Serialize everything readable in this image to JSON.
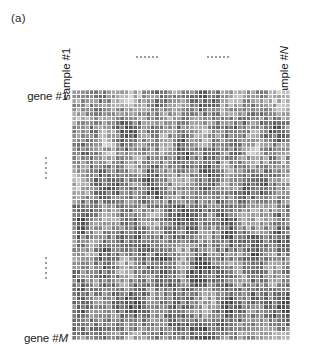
{
  "figure": {
    "panel_label": "(a)",
    "caption_type": "gene-expression-heatmap"
  },
  "axes": {
    "columns": {
      "first_label": "sample #1",
      "last_label_prefix": "sample #",
      "last_label_var": "N",
      "ellipsis_count": 2,
      "ellipsis_dots": 6
    },
    "rows": {
      "first_label": "gene #1",
      "last_label_prefix": "gene #",
      "last_label_var": "M",
      "ellipsis_count": 2,
      "ellipsis_dots": 5
    }
  },
  "chart_data": {
    "type": "heatmap",
    "title": "(a)",
    "xlabel": "",
    "ylabel": "",
    "x_tick_labels": [
      "sample #1",
      "sample #N"
    ],
    "y_tick_labels": [
      "gene #1",
      "gene #M"
    ],
    "grid": true,
    "gridline_color": "#ffffff",
    "legend": "none",
    "colormap": "grayscale",
    "colormap_min_hex": "#ffffff",
    "colormap_max_hex": "#4a4a4a",
    "value_range": [
      0,
      1
    ],
    "n_columns": 50,
    "n_rows": 57,
    "cell_width_px": 4.36,
    "cell_height_px": 4.39,
    "plot_area": {
      "x": 72,
      "y": 90,
      "width": 218,
      "height": 250
    },
    "note": "Values are grayscale intensities per (gene, sample) cell; darker = lower intensity value.",
    "row_mean_intensity": [
      0.62,
      0.58,
      0.6,
      0.55,
      0.57,
      0.52,
      0.59,
      0.54,
      0.5,
      0.56,
      0.53,
      0.49,
      0.55,
      0.47,
      0.51,
      0.46,
      0.5,
      0.44,
      0.48,
      0.43,
      0.45,
      0.41,
      0.44,
      0.4,
      0.42,
      0.39,
      0.43,
      0.38,
      0.41,
      0.37,
      0.4,
      0.36,
      0.39,
      0.35,
      0.38,
      0.37,
      0.36,
      0.38,
      0.35,
      0.37,
      0.34,
      0.36,
      0.33,
      0.35,
      0.34,
      0.36,
      0.33,
      0.35,
      0.32,
      0.34,
      0.33,
      0.35,
      0.32,
      0.34,
      0.33,
      0.36,
      0.4
    ],
    "col_mean_intensity": [
      0.52,
      0.5,
      0.48,
      0.51,
      0.47,
      0.49,
      0.46,
      0.5,
      0.45,
      0.48,
      0.44,
      0.47,
      0.43,
      0.46,
      0.42,
      0.45,
      0.44,
      0.41,
      0.46,
      0.43,
      0.4,
      0.44,
      0.42,
      0.39,
      0.43,
      0.41,
      0.38,
      0.42,
      0.4,
      0.37,
      0.41,
      0.39,
      0.42,
      0.38,
      0.43,
      0.4,
      0.44,
      0.41,
      0.45,
      0.42,
      0.46,
      0.43,
      0.47,
      0.44,
      0.48,
      0.45,
      0.49,
      0.46,
      0.5,
      0.47
    ]
  }
}
